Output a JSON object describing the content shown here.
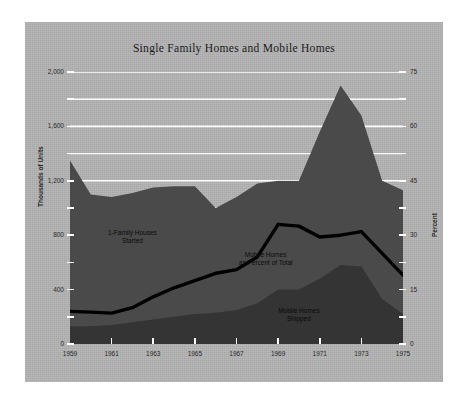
{
  "chart_data": {
    "type": "area",
    "title": "Single Family Homes and Mobile Homes",
    "xlabel": "",
    "ylabel": "Thousands of Units",
    "ylabel_right": "Percent",
    "x": [
      1959,
      1960,
      1961,
      1962,
      1963,
      1964,
      1965,
      1966,
      1967,
      1968,
      1969,
      1970,
      1971,
      1972,
      1973,
      1974,
      1975
    ],
    "xticks": [
      "1959",
      "1961",
      "1963",
      "1965",
      "1967",
      "1969",
      "1971",
      "1973",
      "1975"
    ],
    "xtick_values": [
      1959,
      1961,
      1963,
      1965,
      1967,
      1969,
      1971,
      1973,
      1975
    ],
    "yticks_left": [
      "0",
      "400",
      "800",
      "1,200",
      "1,600",
      "2,000"
    ],
    "ytick_values_left": [
      0,
      400,
      800,
      1200,
      1600,
      2000
    ],
    "yticks_right": [
      "0",
      "15",
      "30",
      "45",
      "60",
      "75"
    ],
    "ytick_values_right": [
      0,
      15,
      30,
      45,
      60,
      75
    ],
    "ylim": [
      0,
      2000
    ],
    "ylim_right": [
      0,
      75
    ],
    "grid": true,
    "grid_color": "#ffffff",
    "background_color": "#b4b4b4",
    "series": [
      {
        "name": "1-Family Houses Started",
        "type": "area",
        "color": "#4a4a4a",
        "axis": "left",
        "units": "thousands of units",
        "values": [
          1350,
          1100,
          1080,
          1110,
          1150,
          1160,
          1160,
          1000,
          1080,
          1180,
          1200,
          1200,
          1560,
          1900,
          1680,
          1200,
          1130
        ]
      },
      {
        "name": "Mobile Homes Shipped",
        "type": "area",
        "color": "#343434",
        "axis": "left",
        "units": "thousands of units",
        "values": [
          130,
          130,
          140,
          160,
          180,
          200,
          220,
          230,
          250,
          300,
          400,
          400,
          480,
          580,
          570,
          330,
          220
        ]
      },
      {
        "name": "Mobile Homes as Percent of Total",
        "type": "line",
        "color": "#000000",
        "axis": "right",
        "units": "percent",
        "values": [
          9.0,
          8.8,
          8.5,
          10.0,
          13.0,
          15.5,
          17.5,
          19.5,
          20.5,
          24.0,
          33.0,
          32.5,
          29.5,
          30.0,
          31.0,
          25.0,
          19.0
        ]
      }
    ],
    "annotations": [
      {
        "text": "1-Family Houses\nStarted",
        "x": 1962.0,
        "y": 800,
        "axis": "left"
      },
      {
        "text": "Mobile Homes\nas Percent of Total",
        "x": 1968.4,
        "y": 24.0,
        "axis": "right"
      },
      {
        "text": "Mobile Homes\nShipped",
        "x": 1970.0,
        "y": 230,
        "axis": "left"
      }
    ]
  }
}
